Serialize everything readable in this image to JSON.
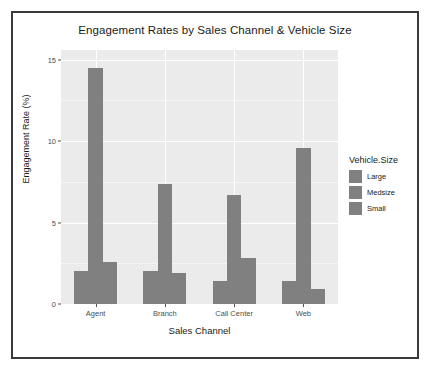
{
  "chart_data": {
    "type": "bar",
    "title": "Engagement Rates by Sales Channel & Vehicle Size",
    "xlabel": "Sales Channel",
    "ylabel": "Engagement Rate (%)",
    "categories": [
      "Agent",
      "Branch",
      "Call Center",
      "Web"
    ],
    "series": [
      {
        "name": "Large",
        "values": [
          2.0,
          2.0,
          1.4,
          1.4
        ]
      },
      {
        "name": "Medsize",
        "values": [
          14.5,
          7.4,
          6.7,
          9.6
        ]
      },
      {
        "name": "Small",
        "values": [
          2.6,
          1.9,
          2.8,
          0.9
        ]
      }
    ],
    "ylim": [
      0,
      15.6
    ],
    "yticks": [
      0,
      5,
      10,
      15
    ],
    "ytick_labels": [
      "0",
      "5",
      "10",
      "15"
    ],
    "grid": true,
    "legend": {
      "title": "Vehicle.Size",
      "position": "right",
      "entries": [
        "Large",
        "Medsize",
        "Small"
      ]
    },
    "colors": {
      "bar": "#808080",
      "panel": "#ebebeb",
      "gridline": "#ffffff",
      "axis_text": "#4d4d4d",
      "title_text": "#1a1a1a",
      "frame_border": "#3a3a3a",
      "background": "#ffffff"
    }
  }
}
